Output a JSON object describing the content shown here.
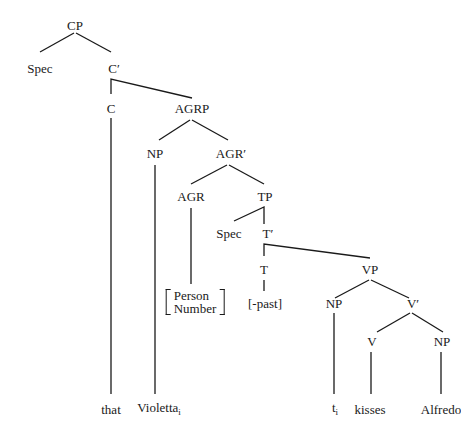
{
  "diagram": {
    "type": "syntax-tree",
    "nodes": {
      "cp": "CP",
      "spec_cp": "Spec",
      "c_bar": "C′",
      "c": "C",
      "agrp": "AGRP",
      "np_subj": "NP",
      "agr_bar": "AGR′",
      "agr": "AGR",
      "tp": "TP",
      "spec_tp": "Spec",
      "t_bar": "T′",
      "t": "T",
      "vp": "VP",
      "np_trace": "NP",
      "v_bar": "V′",
      "v": "V",
      "np_obj": "NP"
    },
    "agr_features": [
      "Person",
      "Number"
    ],
    "tense_feature": "[-past]",
    "leaves": {
      "that": "that",
      "violetta": "Violetta",
      "violetta_index": "i",
      "trace": "t",
      "trace_index": "i",
      "kisses": "kisses",
      "alfredo": "Alfredo"
    },
    "line_color": "#1a1a1a"
  }
}
